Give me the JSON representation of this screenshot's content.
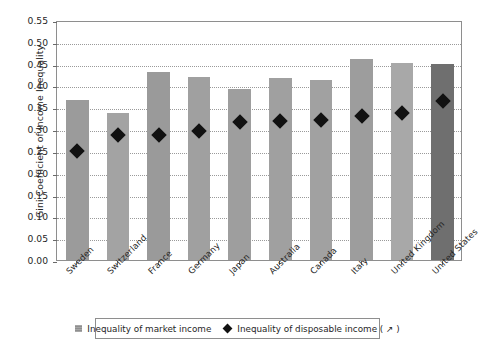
{
  "chart_data": {
    "type": "bar",
    "title": "",
    "xlabel": "",
    "ylabel": "Gini Coefficient of Income Inequality",
    "ylim": [
      0.0,
      0.55
    ],
    "ytick_step": 0.05,
    "ytick_labels": [
      "0.55",
      "0.50",
      "0.45",
      "0.40",
      "0.35",
      "0.30",
      "0.25",
      "0.20",
      "0.15",
      "0.10",
      "0.05",
      "0.00"
    ],
    "ytick_values": [
      0.55,
      0.5,
      0.45,
      0.4,
      0.35,
      0.3,
      0.25,
      0.2,
      0.15,
      0.1,
      0.05,
      0.0
    ],
    "grid": true,
    "grid_axis": "y",
    "legend_position": "bottom",
    "categories": [
      "Sweden",
      "Switzerland",
      "France",
      "Germany",
      "Japan",
      "Australia",
      "Canada",
      "Italy",
      "United Kingdom",
      "United States"
    ],
    "series": [
      {
        "name": "Inequality of market income",
        "type": "bar",
        "color": "#9b9b9b",
        "values": [
          0.367,
          0.337,
          0.43,
          0.42,
          0.393,
          0.416,
          0.413,
          0.46,
          0.452,
          0.45
        ]
      },
      {
        "name": "Inequality of disposable income ( ↗ )",
        "type": "scatter",
        "marker": "diamond",
        "color": "#111111",
        "values": [
          0.255,
          0.29,
          0.292,
          0.301,
          0.321,
          0.322,
          0.326,
          0.335,
          0.341,
          0.37
        ]
      }
    ],
    "bar_colors": [
      "#9b9b9b",
      "#a3a3a3",
      "#9a9a9a",
      "#a0a0a0",
      "#9e9e9e",
      "#a0a0a0",
      "#a1a1a1",
      "#9d9d9d",
      "#a8a8a8",
      "#6f6f6f"
    ]
  },
  "legend": {
    "items": [
      {
        "label": "Inequality of market income",
        "marker": "square"
      },
      {
        "label": "Inequality of disposable income ( ↗ )",
        "marker": "diamond"
      }
    ]
  }
}
